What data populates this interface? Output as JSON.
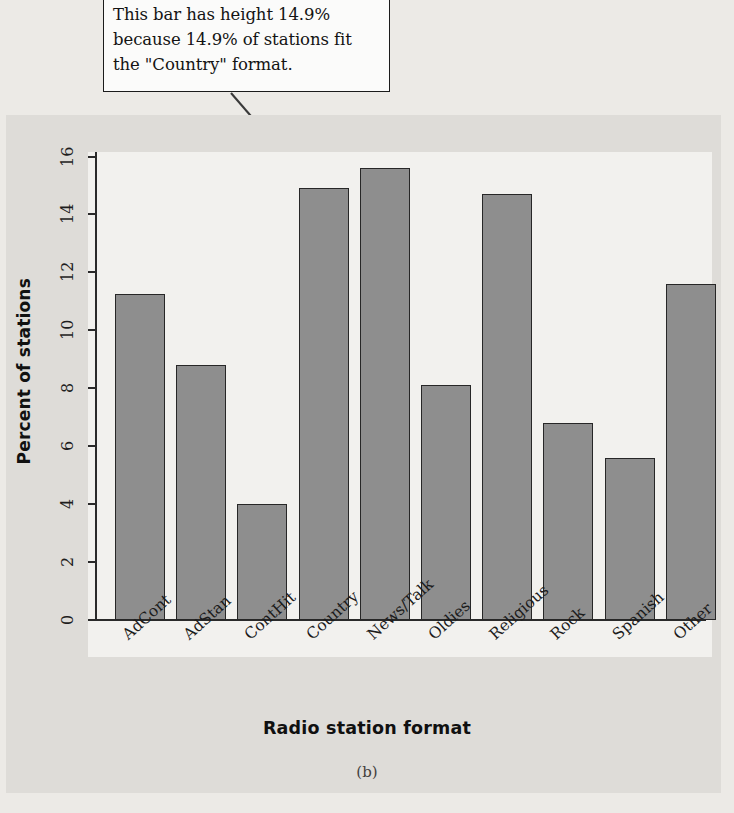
{
  "callout": {
    "line1": "This bar has height 14.9%",
    "line2": "because 14.9% of stations fit",
    "line3": "the \"Country\" format."
  },
  "panel_caption": "(b)",
  "colors": {
    "bar_fill": "#8e8e8e",
    "bar_outline": "#272727",
    "plot_background": "#f2f1ee",
    "figure_background": "#dedcd8",
    "page_background": "#eceae6",
    "axis": "#2a2a2a",
    "callout_border": "#1b1b1b"
  },
  "chart_data": {
    "type": "bar",
    "title": "",
    "xlabel": "Radio station format",
    "ylabel": "Percent of stations",
    "categories": [
      "AdCont",
      "AdStan",
      "ContHit",
      "Country",
      "News/Talk",
      "Oldies",
      "Religious",
      "Rock",
      "Spanish",
      "Other"
    ],
    "values": [
      11.25,
      8.8,
      4.0,
      14.9,
      15.6,
      8.1,
      14.7,
      6.8,
      5.6,
      11.6
    ],
    "ylim": [
      0,
      16
    ],
    "yticks": [
      0,
      2,
      4,
      6,
      8,
      10,
      12,
      14,
      16
    ],
    "ytick_labels": [
      "0",
      "2",
      "4",
      "6",
      "8",
      "10",
      "12",
      "14",
      "16"
    ],
    "grid": false,
    "legend": "none",
    "annotations": [
      {
        "text": "This bar has height 14.9% because 14.9% of stations fit the \"Country\" format.",
        "points_to_category": "Country",
        "points_to_value": 14.9
      }
    ]
  }
}
